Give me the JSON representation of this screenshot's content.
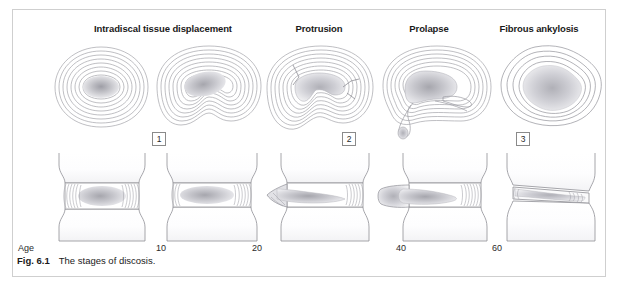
{
  "figure": {
    "border_color": "#cfcfcf",
    "background": "#ffffff",
    "line_color": "#9a9aa0",
    "nucleus_color": "#b9b9bf",
    "caption_number": "Fig. 6.1",
    "caption_text": "The stages of discosis.",
    "age_axis_label": "Age"
  },
  "columns": [
    {
      "heading": "Intradiscal tissue displacement",
      "heading_center_x": 150,
      "heading_y": 22
    },
    {
      "heading": "Protrusion",
      "heading_center_x": 318,
      "heading_y": 22
    },
    {
      "heading": "Prolapse",
      "heading_center_x": 428,
      "heading_y": 22
    },
    {
      "heading": "Fibrous ankylosis",
      "heading_center_x": 538,
      "heading_y": 22
    }
  ],
  "stage_markers": [
    {
      "label": "1",
      "center_x": 158,
      "y": 131
    },
    {
      "label": "2",
      "center_x": 348,
      "y": 131
    },
    {
      "label": "3",
      "center_x": 522,
      "y": 131
    }
  ],
  "age_ticks": [
    {
      "label": "10",
      "center_x": 160,
      "y": 242
    },
    {
      "label": "20",
      "center_x": 256,
      "y": 242
    },
    {
      "label": "40",
      "center_x": 400,
      "y": 242
    },
    {
      "label": "60",
      "center_x": 496,
      "y": 242
    }
  ],
  "panels_top": [
    {
      "name": "transverse-disc-normal",
      "stage": "Intradiscal tissue displacement (early)",
      "description": "Concentric annulus lamellae with central nucleus pulposus",
      "x": 44,
      "y": 40,
      "width": 112,
      "height": 92
    },
    {
      "name": "transverse-disc-displaced",
      "stage": "Intradiscal tissue displacement (advanced)",
      "description": "Nucleus displaced posteriorly, lamellae compressed with notch",
      "x": 150,
      "y": 40,
      "width": 118,
      "height": 92
    },
    {
      "name": "transverse-disc-protrusion",
      "stage": "Protrusion",
      "description": "Radial annular fissures with bulging nucleus",
      "x": 258,
      "y": 40,
      "width": 116,
      "height": 96
    },
    {
      "name": "transverse-disc-prolapse",
      "stage": "Prolapse",
      "description": "Extruded nucleus material escaping through annulus",
      "x": 372,
      "y": 40,
      "width": 122,
      "height": 100
    },
    {
      "name": "transverse-disc-ankylosis",
      "stage": "Fibrous ankylosis",
      "description": "Irregular fibrosed disc with jagged outlines",
      "x": 492,
      "y": 40,
      "width": 110,
      "height": 92
    }
  ],
  "panels_bottom": [
    {
      "name": "lateral-segment-normal",
      "description": "Two vertebral bodies with normal height disc",
      "x": 44,
      "y": 150,
      "width": 112,
      "height": 92
    },
    {
      "name": "lateral-segment-displaced",
      "description": "Disc with slightly flattened nucleus",
      "x": 150,
      "y": 150,
      "width": 118,
      "height": 92
    },
    {
      "name": "lateral-segment-protrusion",
      "description": "Disc bulging anteriorly beyond vertebral margin",
      "x": 258,
      "y": 150,
      "width": 124,
      "height": 92
    },
    {
      "name": "lateral-segment-prolapse",
      "description": "Nucleus extruded anteriorly past vertebral margin",
      "x": 372,
      "y": 150,
      "width": 124,
      "height": 92
    },
    {
      "name": "lateral-segment-ankylosis",
      "description": "Collapsed narrowed disc space with fibrous bridging",
      "x": 488,
      "y": 150,
      "width": 116,
      "height": 92
    }
  ]
}
